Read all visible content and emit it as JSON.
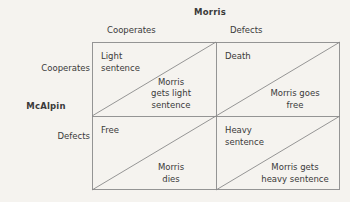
{
  "diagram": {
    "type": "payoff-matrix",
    "column_player": "Morris",
    "row_player": "McAlpin",
    "column_headers": [
      "Cooperates",
      "Defects"
    ],
    "row_headers": [
      "Cooperates",
      "Defects"
    ],
    "line_color": "#8a8a8a",
    "background_color": "#f5f3ef",
    "text_color": "#3a3a3a",
    "cells": [
      {
        "id": "cooperates-cooperates",
        "row": "Cooperates",
        "column": "Cooperates",
        "row_payoff": "Light\nsentence",
        "column_payoff": "Morris\ngets light\nsentence"
      },
      {
        "id": "cooperates-defects",
        "row": "Cooperates",
        "column": "Defects",
        "row_payoff": "Death",
        "column_payoff": "Morris goes\nfree"
      },
      {
        "id": "defects-cooperates",
        "row": "Defects",
        "column": "Cooperates",
        "row_payoff": "Free",
        "column_payoff": "Morris\ndies"
      },
      {
        "id": "defects-defects",
        "row": "Defects",
        "column": "Defects",
        "row_payoff": "Heavy\nsentence",
        "column_payoff": "Morris gets\nheavy sentence"
      }
    ]
  }
}
